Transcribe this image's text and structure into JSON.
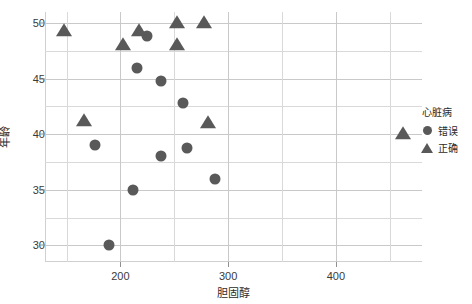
{
  "chart_data": {
    "type": "scatter",
    "title": "",
    "xlabel": "胆固醇",
    "ylabel": "年龄",
    "xlim": [
      130,
      480
    ],
    "ylim": [
      28.5,
      51
    ],
    "grid": true,
    "x_ticks": [
      200,
      300,
      400
    ],
    "y_ticks": [
      30,
      35,
      40,
      45,
      50
    ],
    "x_minor_gridlines": [
      150,
      250,
      350,
      450
    ],
    "y_minor_gridlines": [
      32.5,
      37.5,
      42.5,
      47.5
    ],
    "legend": {
      "title": "心脏病",
      "position": "right",
      "entries": [
        {
          "label": "错误",
          "marker": "circle"
        },
        {
          "label": "正确",
          "marker": "triangle"
        }
      ]
    },
    "marker_color": "#595959",
    "grid_color": "#d9d9d9",
    "series": [
      {
        "name": "错误",
        "marker": "circle",
        "points": [
          {
            "x": 225,
            "y": 48.8
          },
          {
            "x": 215,
            "y": 46.0
          },
          {
            "x": 238,
            "y": 44.8
          },
          {
            "x": 258,
            "y": 42.8
          },
          {
            "x": 176,
            "y": 39.0
          },
          {
            "x": 238,
            "y": 38.0
          },
          {
            "x": 262,
            "y": 38.8
          },
          {
            "x": 212,
            "y": 35.0
          },
          {
            "x": 288,
            "y": 36.0
          },
          {
            "x": 189,
            "y": 30.0
          }
        ]
      },
      {
        "name": "正确",
        "marker": "triangle",
        "points": [
          {
            "x": 148,
            "y": 49.3
          },
          {
            "x": 202,
            "y": 48.0
          },
          {
            "x": 217,
            "y": 49.3
          },
          {
            "x": 253,
            "y": 50.0
          },
          {
            "x": 253,
            "y": 48.0
          },
          {
            "x": 278,
            "y": 50.0
          },
          {
            "x": 281,
            "y": 41.0
          },
          {
            "x": 462,
            "y": 40.0
          },
          {
            "x": 166,
            "y": 41.2
          }
        ]
      }
    ]
  }
}
